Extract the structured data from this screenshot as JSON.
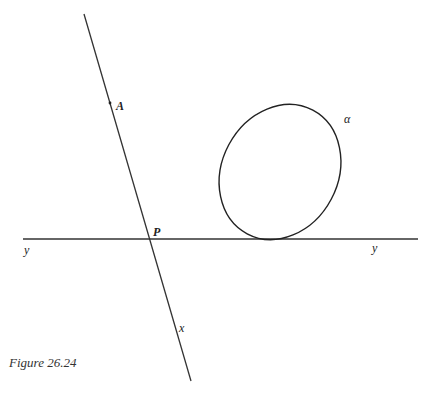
{
  "figure": {
    "caption": "Figure 26.24",
    "labels": {
      "A": "A",
      "P": "P",
      "x": "x",
      "y_left": "y",
      "y_right": "y",
      "alpha": "α"
    },
    "stroke_color": "#222222"
  }
}
